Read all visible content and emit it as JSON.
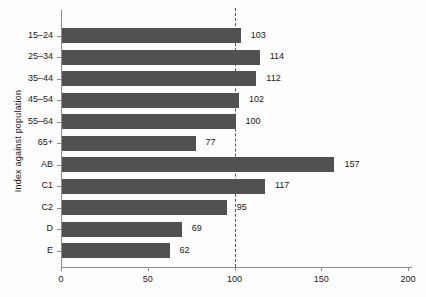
{
  "chart_data": {
    "type": "bar",
    "orientation": "horizontal",
    "title": "",
    "xlabel": "",
    "ylabel": "Index against population",
    "categories": [
      "15–24",
      "25–34",
      "35–44",
      "45–54",
      "55–64",
      "65+",
      "AB",
      "C1",
      "C2",
      "D",
      "E"
    ],
    "values": [
      103,
      114,
      112,
      102,
      100,
      77,
      157,
      117,
      95,
      69,
      62
    ],
    "x_ticks": [
      0,
      50,
      100,
      150,
      200
    ],
    "xlim": [
      0,
      200
    ],
    "reference_line": 100,
    "bar_color": "#515151",
    "axis_color": "#8c8c8c",
    "text_color": "#1a1a1a",
    "grid": "off",
    "legend": "none"
  }
}
